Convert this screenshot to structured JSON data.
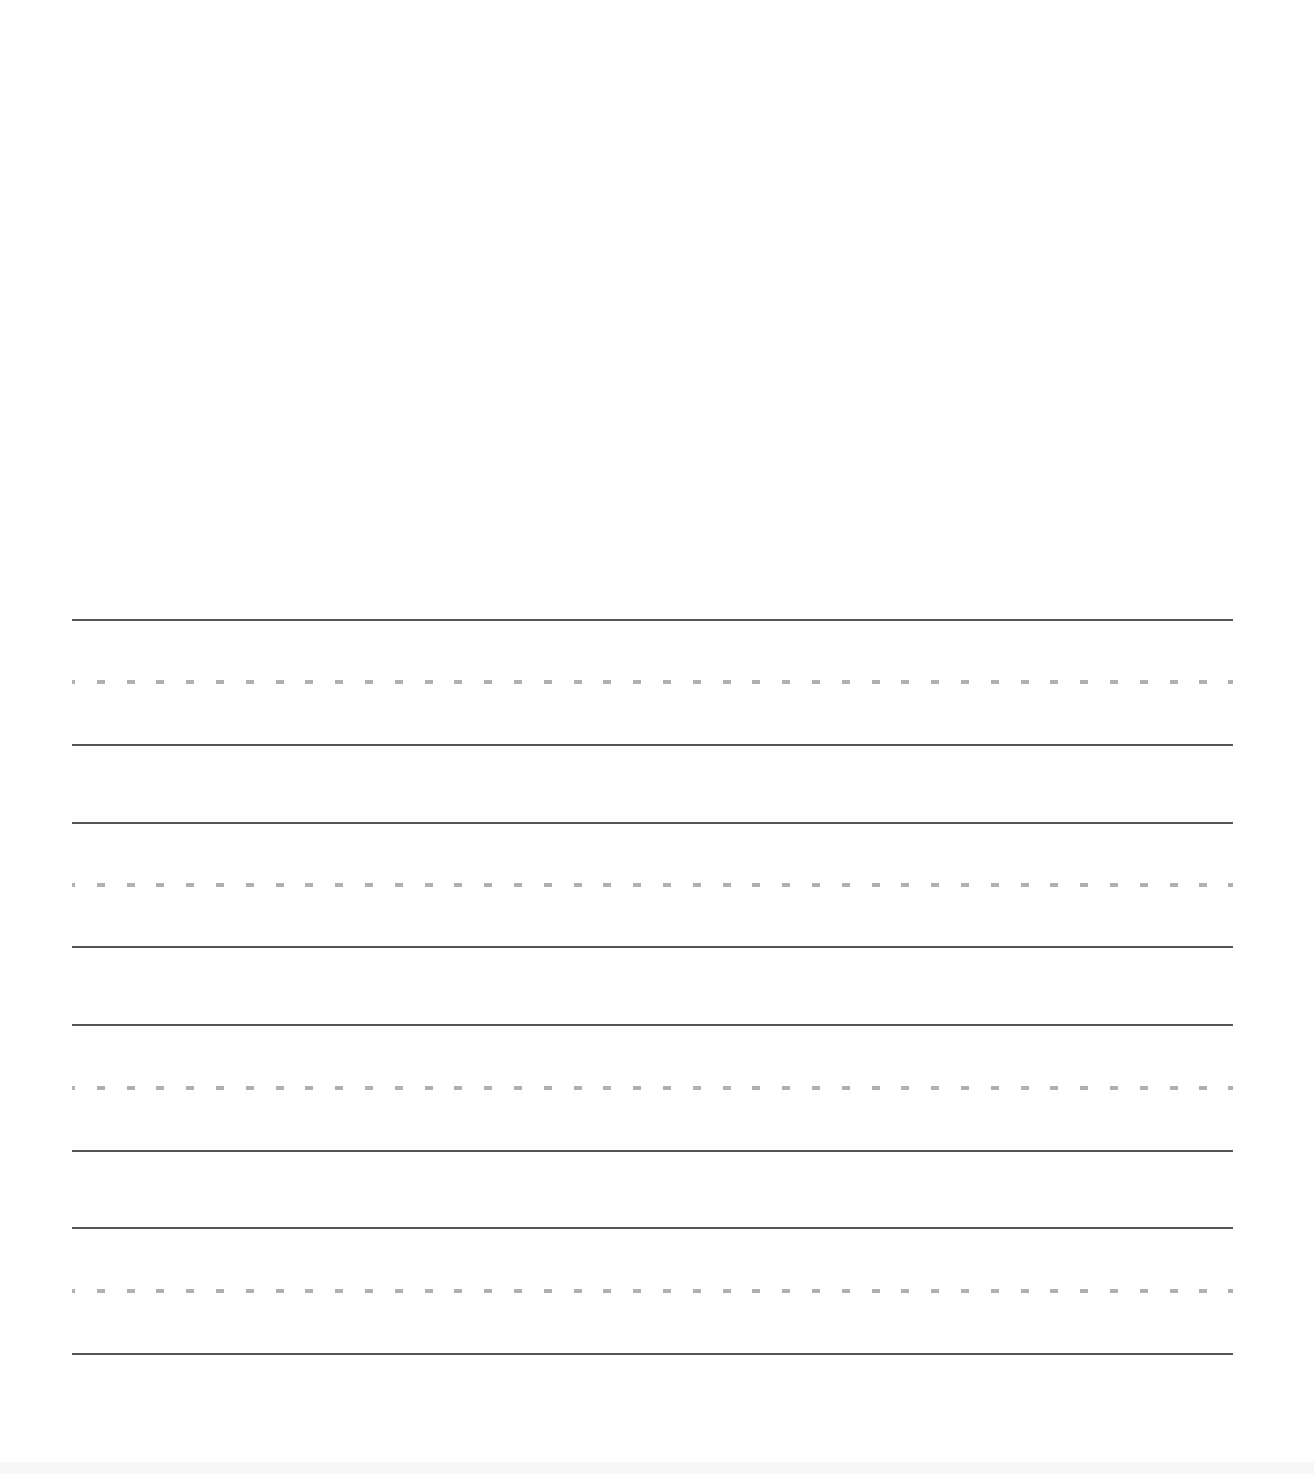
{
  "document": {
    "type": "handwriting practice sheet",
    "background_color": "#ffffff",
    "drawing_area": {
      "content": ""
    },
    "line_colors": {
      "solid": "#555555",
      "dashed": "#b0b0b0"
    },
    "writing_groups": [
      {
        "top_line_y": 620,
        "mid_line_y": 682,
        "base_line_y": 745,
        "text": ""
      },
      {
        "top_line_y": 823,
        "mid_line_y": 885,
        "base_line_y": 947,
        "text": ""
      },
      {
        "top_line_y": 1025,
        "mid_line_y": 1088,
        "base_line_y": 1151,
        "text": ""
      },
      {
        "top_line_y": 1228,
        "mid_line_y": 1291,
        "base_line_y": 1354,
        "text": ""
      }
    ]
  }
}
